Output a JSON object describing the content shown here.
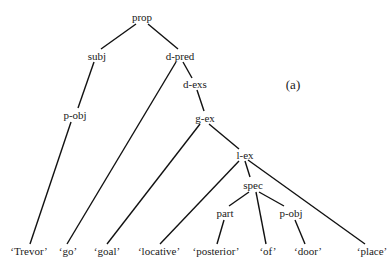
{
  "diagram": {
    "type": "syntax-tree",
    "panel_label": "(a)",
    "nodes": {
      "prop": "prop",
      "subj": "subj",
      "d_pred": "d-pred",
      "d_exs": "d-exs",
      "p_obj_subj": "p-obj",
      "g_ex": "g-ex",
      "l_ex": "l-ex",
      "spec": "spec",
      "part": "part",
      "p_obj_spec": "p-obj"
    },
    "leaves": {
      "trevor": "‘Trevor’",
      "go": "‘go’",
      "goal": "‘goal’",
      "locative": "‘locative’",
      "posterior": "‘posterior’",
      "of": "‘of’",
      "door": "‘door’",
      "place": "‘place’"
    },
    "edges": [
      [
        "prop",
        "subj"
      ],
      [
        "prop",
        "d-pred"
      ],
      [
        "subj",
        "p-obj"
      ],
      [
        "p-obj",
        "'Trevor'"
      ],
      [
        "d-pred",
        "'go'"
      ],
      [
        "d-pred",
        "d-exs"
      ],
      [
        "d-exs",
        "g-ex"
      ],
      [
        "g-ex",
        "'goal'"
      ],
      [
        "g-ex",
        "l-ex"
      ],
      [
        "l-ex",
        "'locative'"
      ],
      [
        "l-ex",
        "spec"
      ],
      [
        "l-ex",
        "'place'"
      ],
      [
        "spec",
        "part"
      ],
      [
        "spec",
        "'of'"
      ],
      [
        "spec",
        "p-obj"
      ],
      [
        "part",
        "'posterior'"
      ],
      [
        "p-obj",
        "'door'"
      ]
    ]
  }
}
